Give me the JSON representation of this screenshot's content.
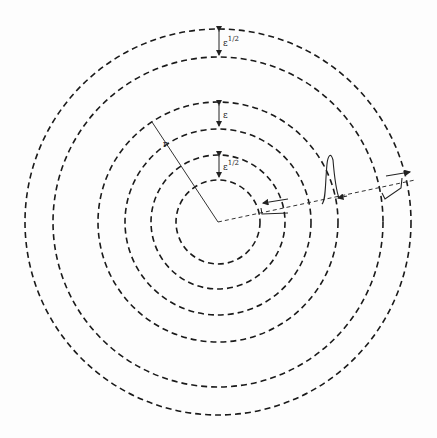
{
  "diagram": {
    "type": "concentric-dashed-circles",
    "center": [
      218,
      222
    ],
    "circles": [
      {
        "id": "c1",
        "r": 42
      },
      {
        "id": "c2",
        "r": 67
      },
      {
        "id": "c3",
        "r": 93
      },
      {
        "id": "c4",
        "r": 120
      },
      {
        "id": "c5",
        "r": 165
      },
      {
        "id": "c6",
        "r": 193
      }
    ],
    "gap_labels": [
      {
        "id": "gap-outer",
        "text": "ε",
        "sup": "1/2"
      },
      {
        "id": "gap-middle",
        "text": "ε",
        "sup": ""
      },
      {
        "id": "gap-inner",
        "text": "ε",
        "sup": "1/2"
      }
    ],
    "radius_label": "r"
  }
}
